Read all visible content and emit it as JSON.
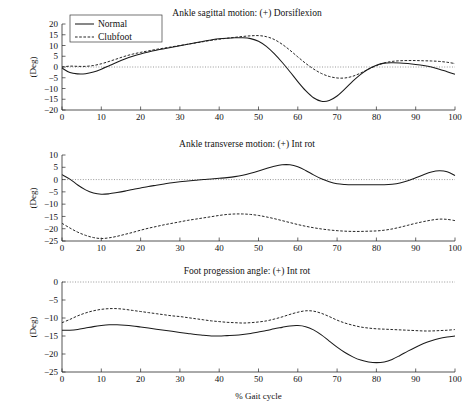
{
  "figure": {
    "xlabel": "% Gait cycle",
    "ylabel": "(Deg)",
    "background": "#ffffff",
    "line_color": "#1a1a1a"
  },
  "legend": {
    "position": "top-left",
    "entries": [
      {
        "label": "Normal",
        "style": "solid"
      },
      {
        "label": "Clubfoot",
        "style": "dashed"
      }
    ]
  },
  "chart_data": [
    {
      "type": "line",
      "title": "Ankle sagittal motion: (+) Dorsiflexion",
      "xlabel": "",
      "ylabel": "(Deg)",
      "xlim": [
        0,
        100
      ],
      "ylim": [
        -20,
        20
      ],
      "xticks": [
        0,
        10,
        20,
        30,
        40,
        50,
        60,
        70,
        80,
        90,
        100
      ],
      "yticks": [
        20,
        15,
        10,
        5,
        0,
        -5,
        -10,
        -15,
        -20
      ],
      "grid": false,
      "zero_reference": 0,
      "x": [
        0,
        2,
        4,
        6,
        8,
        10,
        12,
        14,
        16,
        18,
        20,
        22,
        24,
        26,
        28,
        30,
        32,
        34,
        36,
        38,
        40,
        42,
        44,
        46,
        48,
        50,
        52,
        54,
        56,
        58,
        60,
        62,
        64,
        66,
        68,
        70,
        72,
        74,
        76,
        78,
        80,
        82,
        84,
        86,
        88,
        90,
        92,
        94,
        96,
        98,
        100
      ],
      "series": [
        {
          "name": "Normal",
          "style": "solid",
          "values": [
            -0.5,
            -2.6,
            -3.2,
            -3.1,
            -2.3,
            -1.0,
            0.6,
            2.2,
            3.7,
            5.0,
            6.1,
            7.0,
            7.8,
            8.5,
            9.2,
            9.9,
            10.6,
            11.3,
            12.0,
            12.6,
            13.1,
            13.4,
            13.6,
            13.6,
            13.2,
            12.0,
            9.6,
            6.2,
            2.2,
            -2.2,
            -6.8,
            -11.0,
            -14.3,
            -15.9,
            -15.6,
            -13.5,
            -10.2,
            -6.6,
            -3.4,
            -0.9,
            0.8,
            1.8,
            2.0,
            1.9,
            1.6,
            1.2,
            0.7,
            0.0,
            -1.0,
            -2.2,
            -3.4
          ]
        },
        {
          "name": "Clubfoot",
          "style": "dashed",
          "values": [
            0.0,
            0.4,
            0.3,
            0.3,
            0.7,
            1.5,
            2.6,
            3.8,
            5.0,
            6.0,
            6.8,
            7.5,
            8.2,
            8.8,
            9.4,
            10.0,
            10.6,
            11.2,
            11.8,
            12.4,
            12.9,
            13.4,
            13.8,
            14.2,
            14.5,
            14.6,
            14.1,
            12.8,
            10.6,
            7.8,
            4.7,
            1.7,
            -0.9,
            -3.0,
            -4.4,
            -5.1,
            -5.1,
            -4.3,
            -2.8,
            -1.0,
            0.6,
            1.9,
            2.6,
            2.9,
            3.0,
            3.0,
            2.9,
            2.8,
            2.6,
            2.2,
            1.6
          ]
        }
      ]
    },
    {
      "type": "line",
      "title": "Ankle transverse motion: (+) Int rot",
      "xlabel": "",
      "ylabel": "(Deg)",
      "xlim": [
        0,
        100
      ],
      "ylim": [
        -25,
        10
      ],
      "xticks": [
        0,
        10,
        20,
        30,
        40,
        50,
        60,
        70,
        80,
        90,
        100
      ],
      "yticks": [
        10,
        5,
        0,
        -5,
        -10,
        -15,
        -20,
        -25
      ],
      "grid": false,
      "zero_reference": 0,
      "x": [
        0,
        2,
        4,
        6,
        8,
        10,
        12,
        14,
        16,
        18,
        20,
        22,
        24,
        26,
        28,
        30,
        32,
        34,
        36,
        38,
        40,
        42,
        44,
        46,
        48,
        50,
        52,
        54,
        56,
        58,
        60,
        62,
        64,
        66,
        68,
        70,
        72,
        74,
        76,
        78,
        80,
        82,
        84,
        86,
        88,
        90,
        92,
        94,
        96,
        98,
        100
      ],
      "series": [
        {
          "name": "Normal",
          "style": "solid",
          "values": [
            2.0,
            0.2,
            -2.2,
            -4.2,
            -5.5,
            -6.0,
            -5.8,
            -5.3,
            -4.7,
            -4.0,
            -3.4,
            -2.8,
            -2.3,
            -1.8,
            -1.3,
            -0.9,
            -0.6,
            -0.3,
            0.0,
            0.2,
            0.5,
            0.8,
            1.2,
            1.8,
            2.6,
            3.5,
            4.5,
            5.4,
            6.0,
            6.0,
            5.2,
            3.7,
            1.9,
            0.3,
            -0.9,
            -1.7,
            -2.0,
            -2.1,
            -2.1,
            -2.1,
            -2.1,
            -2.1,
            -1.9,
            -1.4,
            -0.5,
            0.7,
            2.0,
            3.1,
            3.6,
            3.2,
            1.6
          ]
        },
        {
          "name": "Clubfoot",
          "style": "dashed",
          "values": [
            -17.8,
            -19.7,
            -21.4,
            -22.7,
            -23.6,
            -24.0,
            -23.7,
            -23.1,
            -22.3,
            -21.5,
            -20.6,
            -19.8,
            -19.1,
            -18.4,
            -17.8,
            -17.2,
            -16.6,
            -16.1,
            -15.6,
            -15.1,
            -14.6,
            -14.2,
            -14.0,
            -14.0,
            -14.2,
            -14.6,
            -15.2,
            -15.9,
            -16.7,
            -17.5,
            -18.3,
            -19.0,
            -19.6,
            -20.1,
            -20.5,
            -20.8,
            -21.0,
            -21.1,
            -21.1,
            -21.0,
            -20.9,
            -20.6,
            -20.1,
            -19.4,
            -18.6,
            -17.8,
            -17.1,
            -16.5,
            -16.1,
            -16.2,
            -16.7
          ]
        }
      ]
    },
    {
      "type": "line",
      "title": "Foot progession angle: (+) Int rot",
      "xlabel": "% Gait cycle",
      "ylabel": "(Deg)",
      "xlim": [
        0,
        100
      ],
      "ylim": [
        -25,
        0
      ],
      "xticks": [
        0,
        10,
        20,
        30,
        40,
        50,
        60,
        70,
        80,
        90,
        100
      ],
      "yticks": [
        0,
        -5,
        -10,
        -15,
        -20,
        -25
      ],
      "grid": false,
      "zero_reference": 0,
      "x": [
        0,
        2,
        4,
        6,
        8,
        10,
        12,
        14,
        16,
        18,
        20,
        22,
        24,
        26,
        28,
        30,
        32,
        34,
        36,
        38,
        40,
        42,
        44,
        46,
        48,
        50,
        52,
        54,
        56,
        58,
        60,
        62,
        64,
        66,
        68,
        70,
        72,
        74,
        76,
        78,
        80,
        82,
        84,
        86,
        88,
        90,
        92,
        94,
        96,
        98,
        100
      ],
      "series": [
        {
          "name": "Normal",
          "style": "solid",
          "values": [
            -13.4,
            -13.4,
            -13.2,
            -12.8,
            -12.4,
            -12.1,
            -11.9,
            -11.9,
            -12.0,
            -12.2,
            -12.5,
            -12.8,
            -13.1,
            -13.4,
            -13.7,
            -14.0,
            -14.3,
            -14.6,
            -14.8,
            -15.0,
            -15.0,
            -14.9,
            -14.8,
            -14.6,
            -14.3,
            -13.9,
            -13.5,
            -13.0,
            -12.6,
            -12.2,
            -12.1,
            -12.4,
            -13.3,
            -14.7,
            -16.4,
            -18.1,
            -19.6,
            -20.8,
            -21.7,
            -22.2,
            -22.4,
            -22.2,
            -21.5,
            -20.4,
            -19.2,
            -18.1,
            -17.1,
            -16.3,
            -15.7,
            -15.3,
            -15.0
          ]
        },
        {
          "name": "Clubfoot",
          "style": "dashed",
          "values": [
            -11.3,
            -10.4,
            -9.4,
            -8.6,
            -8.0,
            -7.6,
            -7.4,
            -7.4,
            -7.6,
            -7.9,
            -8.2,
            -8.5,
            -8.8,
            -9.1,
            -9.4,
            -9.6,
            -9.9,
            -10.2,
            -10.5,
            -10.8,
            -11.0,
            -11.2,
            -11.3,
            -11.4,
            -11.3,
            -11.1,
            -10.8,
            -10.3,
            -9.7,
            -9.0,
            -8.4,
            -8.0,
            -8.1,
            -8.7,
            -9.6,
            -10.6,
            -11.4,
            -12.0,
            -12.5,
            -12.8,
            -13.0,
            -13.1,
            -13.2,
            -13.3,
            -13.4,
            -13.5,
            -13.6,
            -13.6,
            -13.5,
            -13.4,
            -13.2
          ]
        }
      ]
    }
  ]
}
